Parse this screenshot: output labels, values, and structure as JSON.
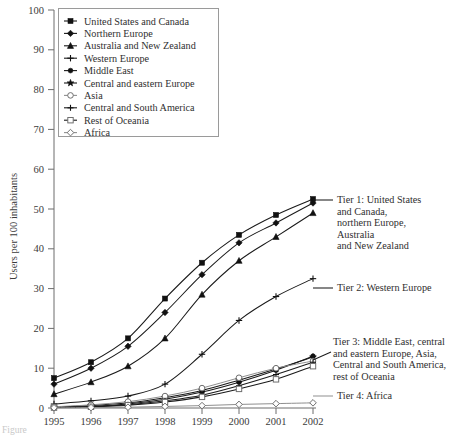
{
  "chart_data": {
    "type": "line",
    "title": "",
    "xlabel": "",
    "ylabel": "Users per 100 inhabitants",
    "x": [
      1995,
      1996,
      1997,
      1998,
      1999,
      2000,
      2001,
      2002
    ],
    "xtick_labels": [
      "1995",
      "1996",
      "1997",
      "1998",
      "1999",
      "2000",
      "2001",
      "2002"
    ],
    "ytick_labels": [
      "0",
      "10",
      "20",
      "30",
      "40",
      "50",
      "60",
      "70",
      "80",
      "90",
      "100"
    ],
    "ylim": [
      0,
      100
    ],
    "ytick_step": 10,
    "grid": false,
    "legend_position": "upper-left-inside",
    "series": [
      {
        "name": "United States and Canada",
        "marker": "filled-square",
        "tone": "dark",
        "values": [
          7.5,
          11.5,
          17.5,
          27.5,
          36.5,
          43.5,
          48.5,
          52.5
        ]
      },
      {
        "name": "Northern Europe",
        "marker": "filled-diamond",
        "tone": "dark",
        "values": [
          6.0,
          10.0,
          15.5,
          24.0,
          33.5,
          41.5,
          46.5,
          51.5
        ]
      },
      {
        "name": "Australia and New Zealand",
        "marker": "filled-triangle",
        "tone": "dark",
        "values": [
          3.5,
          6.5,
          10.5,
          17.5,
          28.5,
          37.0,
          43.0,
          49.0
        ]
      },
      {
        "name": "Western Europe",
        "marker": "cross-plus",
        "tone": "dark",
        "values": [
          1.0,
          1.8,
          3.0,
          6.0,
          13.5,
          22.0,
          28.0,
          32.5
        ]
      },
      {
        "name": "Middle East",
        "marker": "filled-circle",
        "tone": "dark",
        "values": [
          0.1,
          0.4,
          1.0,
          2.2,
          4.0,
          6.5,
          9.5,
          13.0
        ]
      },
      {
        "name": "Central and eastern Europe",
        "marker": "filled-star",
        "tone": "dark",
        "values": [
          0.2,
          0.6,
          1.3,
          2.6,
          4.4,
          7.0,
          9.8,
          12.8
        ]
      },
      {
        "name": "Asia",
        "marker": "open-circle",
        "tone": "light",
        "values": [
          0.3,
          0.8,
          1.6,
          3.0,
          5.0,
          7.6,
          10.0,
          11.8
        ]
      },
      {
        "name": "Central and South America",
        "marker": "plus",
        "tone": "dark",
        "values": [
          0.1,
          0.3,
          0.8,
          1.8,
          3.2,
          5.6,
          8.4,
          11.5
        ]
      },
      {
        "name": "Rest of Oceania",
        "marker": "open-square",
        "tone": "dark",
        "values": [
          0.1,
          0.3,
          0.7,
          1.5,
          2.8,
          4.8,
          7.2,
          10.5
        ]
      },
      {
        "name": "Africa",
        "marker": "open-diamond",
        "tone": "light",
        "values": [
          0.05,
          0.1,
          0.2,
          0.4,
          0.6,
          0.9,
          1.1,
          1.3
        ]
      }
    ],
    "annotations": [
      {
        "id": "tier1",
        "lines": [
          "Tier 1: United States",
          "and Canada,",
          "northern Europe,",
          "Australia",
          "and New Zealand"
        ]
      },
      {
        "id": "tier2",
        "lines": [
          "Tier 2: Western Europe"
        ]
      },
      {
        "id": "tier3",
        "lines": [
          "Tier 3: Middle East, central",
          "and eastern Europe, Asia,",
          "Central and South America,",
          "rest of Oceania"
        ]
      },
      {
        "id": "tier4",
        "lines": [
          "Tier 4: Africa"
        ]
      }
    ]
  },
  "legend": {
    "items": [
      {
        "label": "United States and Canada",
        "marker": "filled-square",
        "tone": "dark"
      },
      {
        "label": "Northern Europe",
        "marker": "filled-diamond",
        "tone": "dark"
      },
      {
        "label": "Australia and New Zealand",
        "marker": "filled-triangle",
        "tone": "dark"
      },
      {
        "label": "Western Europe",
        "marker": "cross-plus",
        "tone": "dark"
      },
      {
        "label": "Middle East",
        "marker": "filled-circle",
        "tone": "dark"
      },
      {
        "label": "Central and eastern Europe",
        "marker": "filled-star",
        "tone": "dark"
      },
      {
        "label": "Asia",
        "marker": "open-circle",
        "tone": "light"
      },
      {
        "label": "Central and South America",
        "marker": "plus",
        "tone": "dark"
      },
      {
        "label": "Rest of Oceania",
        "marker": "open-square",
        "tone": "dark"
      },
      {
        "label": "Africa",
        "marker": "open-diamond",
        "tone": "light"
      }
    ]
  },
  "caption": {
    "text": "Figure"
  },
  "colors": {
    "ink": "#1a1a1a",
    "axis": "#6d6d6d",
    "light_series": "#8f8f8f",
    "legend_border": "#9a9a9a",
    "background": "#ffffff"
  }
}
